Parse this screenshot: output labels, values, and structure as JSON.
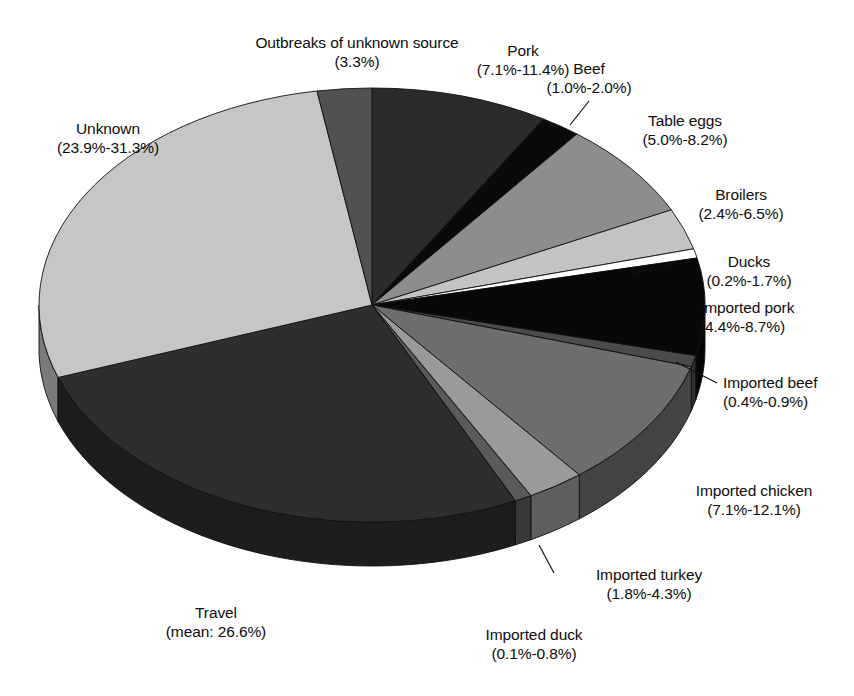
{
  "figure": {
    "type": "pie-3d",
    "background": "#ffffff"
  },
  "chart_data": {
    "type": "pie",
    "title": "",
    "subtitle": "",
    "xlabel": "",
    "ylabel": "",
    "legend_position": "callout-labels",
    "grid": false,
    "note": "Attributed sources of human campylobacteriosis; values are label-reported ranges, wedge angles estimated from pixels.",
    "categories": [
      "Pork",
      "Beef",
      "Table eggs",
      "Broilers",
      "Ducks",
      "Imported pork",
      "Imported beef",
      "Imported chicken",
      "Imported turkey",
      "Imported duck",
      "Travel",
      "Unknown",
      "Outbreaks of unknown source"
    ],
    "value_labels": [
      "(7.1%-11.4%)",
      "(1.0%-2.0%)",
      "(5.0%-8.2%)",
      "(2.4%-6.5%)",
      "(0.2%-1.7%)",
      "(4.4%-8.7%)",
      "(0.4%-0.9%)",
      "(7.1%-12.1%)",
      "(1.8%-4.3%)",
      "(0.1%-0.8%)",
      "(mean: 26.6%)",
      "(23.9%-31.3%)",
      "(3.3%)"
    ],
    "values": [
      9.25,
      1.5,
      6.6,
      4.45,
      0.95,
      6.55,
      0.65,
      9.6,
      3.05,
      0.45,
      26.6,
      27.6,
      3.3
    ],
    "ranges": [
      [
        7.1,
        11.4
      ],
      [
        1.0,
        2.0
      ],
      [
        5.0,
        8.2
      ],
      [
        2.4,
        6.5
      ],
      [
        0.2,
        1.7
      ],
      [
        4.4,
        8.7
      ],
      [
        0.4,
        0.9
      ],
      [
        7.1,
        12.1
      ],
      [
        1.8,
        4.3
      ],
      [
        0.1,
        0.8
      ],
      [
        26.6,
        26.6
      ],
      [
        23.9,
        31.3
      ],
      [
        3.3,
        3.3
      ]
    ],
    "slice_colors": [
      "#2b2b2b",
      "#0a0a0a",
      "#8d8d8d",
      "#c3c3c3",
      "#ffffff",
      "#080808",
      "#4b4b4b",
      "#6e6e6e",
      "#9a9a9a",
      "#5a5a5a",
      "#2e2e2e",
      "#c6c6c6",
      "#515151"
    ],
    "slice_angles_deg": {
      "start_at_top_clockwise": true,
      "spans": [
        31.0,
        7.0,
        26.0,
        11.0,
        2.5,
        26.0,
        3.0,
        35.0,
        10.0,
        3.0,
        96.0,
        100.0,
        9.5
      ]
    }
  },
  "labels": [
    {
      "name": "outbreaks-of-unknown-source",
      "line1": "Outbreaks of unknown source",
      "line2": "(3.3%)"
    },
    {
      "name": "pork",
      "line1": "Pork",
      "line2": "(7.1%-11.4%)"
    },
    {
      "name": "beef",
      "line1": "Beef",
      "line2": "(1.0%-2.0%)"
    },
    {
      "name": "table-eggs",
      "line1": "Table eggs",
      "line2": "(5.0%-8.2%)"
    },
    {
      "name": "broilers",
      "line1": "Broilers",
      "line2": "(2.4%-6.5%)"
    },
    {
      "name": "ducks",
      "line1": "Ducks",
      "line2": "(0.2%-1.7%)"
    },
    {
      "name": "imported-pork",
      "line1": "Imported pork",
      "line2": "(4.4%-8.7%)"
    },
    {
      "name": "imported-beef",
      "line1": "Imported beef",
      "line2": "(0.4%-0.9%)"
    },
    {
      "name": "imported-chicken",
      "line1": "Imported chicken",
      "line2": "(7.1%-12.1%)"
    },
    {
      "name": "imported-turkey",
      "line1": "Imported turkey",
      "line2": "(1.8%-4.3%)"
    },
    {
      "name": "imported-duck",
      "line1": "Imported duck",
      "line2": "(0.1%-0.8%)"
    },
    {
      "name": "travel",
      "line1": "Travel",
      "line2": "(mean: 26.6%)"
    },
    {
      "name": "unknown",
      "line1": "Unknown",
      "line2": "(23.9%-31.3%)"
    }
  ]
}
